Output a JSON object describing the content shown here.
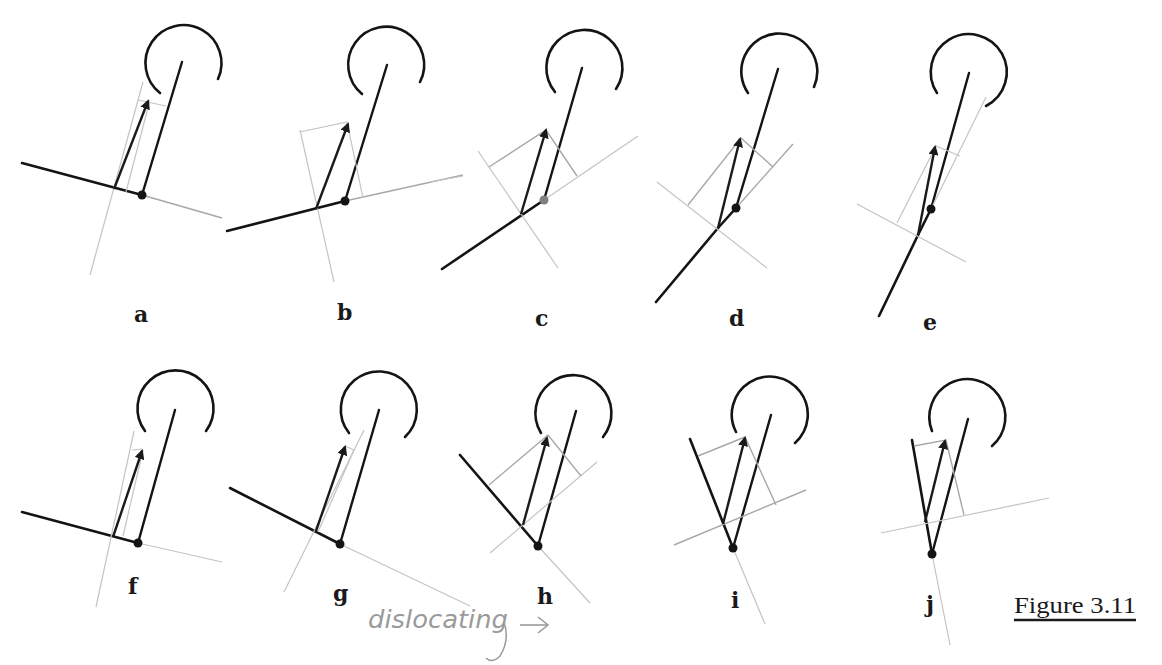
{
  "figure": {
    "title": "Figure 3.11",
    "annotation": "dislocating",
    "annotation_arrow": "→",
    "colors": {
      "ink": "#141414",
      "construction": "#a8a8a8",
      "annotation": "#9a9a9a"
    }
  },
  "panels": [
    {
      "label": "a"
    },
    {
      "label": "b"
    },
    {
      "label": "c"
    },
    {
      "label": "d"
    },
    {
      "label": "e"
    },
    {
      "label": "f"
    },
    {
      "label": "g"
    },
    {
      "label": "h"
    },
    {
      "label": "i"
    },
    {
      "label": "j"
    }
  ]
}
